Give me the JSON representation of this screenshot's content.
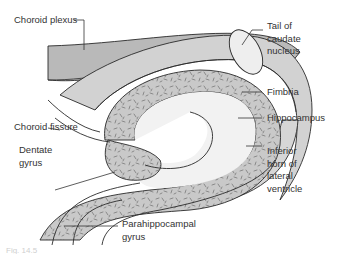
{
  "diagram": {
    "type": "anatomical-cross-section",
    "colors": {
      "choroid_plexus_fill": "#b9b9b9",
      "ventricle_fill": "#d6d6d6",
      "grey_matter_fill": "#c7c7c7",
      "white_matter_fill": "#efefef",
      "outline": "#2a2a2a",
      "label_text": "#333333"
    },
    "labels": {
      "choroid_plexus": "Choroid plexus",
      "tail_of_caudate": "Tail of\ncaudate\nnucleus",
      "fimbria": "Fimbria",
      "choroid_fissure": "Choroid fissure",
      "hippocampus": "Hippocampus",
      "dentate_gyrus": "Dentate\ngyrus",
      "inferior_horn": "Inferior\nhorn of\nlateral\nventricle",
      "parahippocampal_gyrus": "Parahippocampal\ngyrus"
    },
    "caption": "Fig. 14.5"
  }
}
